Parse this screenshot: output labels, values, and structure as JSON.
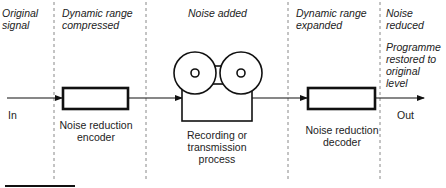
{
  "stages": [
    {
      "id": "original",
      "label": "Original\nsignal"
    },
    {
      "id": "compressed",
      "label": "Dynamic range\ncompressed"
    },
    {
      "id": "noise_added",
      "label": "Noise added"
    },
    {
      "id": "expanded",
      "label": "Dynamic range\nexpanded"
    },
    {
      "id": "noise_reduced",
      "label": "Noise\nreduced"
    }
  ],
  "note": "Programme\nrestored to\noriginal\nlevel",
  "blocks": {
    "encoder": "Noise reduction\nencoder",
    "recorder": "Recording or\ntransmission\nprocess",
    "decoder": "Noise reduction\ndecoder"
  },
  "io": {
    "input": "In",
    "output": "Out"
  },
  "colors": {
    "line": "#111111",
    "divider": "#888888",
    "text": "#222222"
  }
}
